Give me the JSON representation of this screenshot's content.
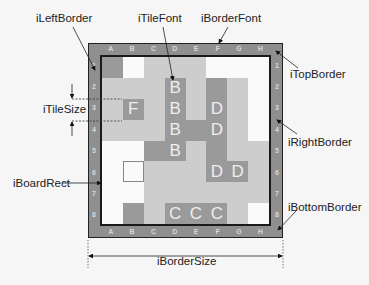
{
  "labels": {
    "left_border": "iLeftBorder",
    "tile_font": "iTileFont",
    "border_font": "iBorderFont",
    "top_border": "iTopBorder",
    "tile_size": "iTileSize",
    "right_border": "iRightBorder",
    "board_rect": "iBoardRect",
    "bottom_border": "iBottomBorder",
    "border_size": "iBorderSize"
  },
  "columns": [
    "A",
    "B",
    "C",
    "D",
    "E",
    "F",
    "G",
    "H"
  ],
  "rows": [
    "1",
    "2",
    "3",
    "4",
    "5",
    "6",
    "7",
    "8"
  ],
  "board": [
    [
      {
        "s": "dark",
        "t": ""
      },
      {
        "s": "white",
        "t": ""
      },
      {
        "s": "light",
        "t": ""
      },
      {
        "s": "light",
        "t": ""
      },
      {
        "s": "light",
        "t": ""
      },
      {
        "s": "white",
        "t": ""
      },
      {
        "s": "white",
        "t": ""
      },
      {
        "s": "white",
        "t": ""
      }
    ],
    [
      {
        "s": "light",
        "t": ""
      },
      {
        "s": "light",
        "t": ""
      },
      {
        "s": "light",
        "t": ""
      },
      {
        "s": "dark",
        "t": "B"
      },
      {
        "s": "light",
        "t": ""
      },
      {
        "s": "dark",
        "t": ""
      },
      {
        "s": "light",
        "t": ""
      },
      {
        "s": "white",
        "t": ""
      }
    ],
    [
      {
        "s": "light",
        "t": ""
      },
      {
        "s": "dark",
        "t": "F"
      },
      {
        "s": "light",
        "t": ""
      },
      {
        "s": "dark",
        "t": "B"
      },
      {
        "s": "light",
        "t": ""
      },
      {
        "s": "dark",
        "t": "D"
      },
      {
        "s": "light",
        "t": ""
      },
      {
        "s": "white",
        "t": ""
      }
    ],
    [
      {
        "s": "light",
        "t": ""
      },
      {
        "s": "light",
        "t": ""
      },
      {
        "s": "light",
        "t": ""
      },
      {
        "s": "dark",
        "t": "B"
      },
      {
        "s": "dark",
        "t": ""
      },
      {
        "s": "dark",
        "t": "D"
      },
      {
        "s": "light",
        "t": ""
      },
      {
        "s": "white",
        "t": ""
      }
    ],
    [
      {
        "s": "white",
        "t": ""
      },
      {
        "s": "white",
        "t": ""
      },
      {
        "s": "dark",
        "t": ""
      },
      {
        "s": "dark",
        "t": "B"
      },
      {
        "s": "light",
        "t": ""
      },
      {
        "s": "dark",
        "t": ""
      },
      {
        "s": "light",
        "t": ""
      },
      {
        "s": "light",
        "t": ""
      }
    ],
    [
      {
        "s": "white",
        "t": ""
      },
      {
        "s": "outline",
        "t": ""
      },
      {
        "s": "light",
        "t": ""
      },
      {
        "s": "light",
        "t": ""
      },
      {
        "s": "light",
        "t": ""
      },
      {
        "s": "dark",
        "t": "D"
      },
      {
        "s": "dark",
        "t": "D"
      },
      {
        "s": "light",
        "t": ""
      }
    ],
    [
      {
        "s": "white",
        "t": ""
      },
      {
        "s": "white",
        "t": ""
      },
      {
        "s": "light",
        "t": ""
      },
      {
        "s": "light",
        "t": ""
      },
      {
        "s": "light",
        "t": ""
      },
      {
        "s": "light",
        "t": ""
      },
      {
        "s": "light",
        "t": ""
      },
      {
        "s": "light",
        "t": ""
      }
    ],
    [
      {
        "s": "white",
        "t": ""
      },
      {
        "s": "dark",
        "t": ""
      },
      {
        "s": "light",
        "t": ""
      },
      {
        "s": "dark",
        "t": "C"
      },
      {
        "s": "dark",
        "t": "C"
      },
      {
        "s": "dark",
        "t": "C"
      },
      {
        "s": "light",
        "t": ""
      },
      {
        "s": "white",
        "t": ""
      }
    ]
  ],
  "colors": {
    "border": "#8f8f8f",
    "dark_tile": "#9a9a9a",
    "light_tile": "#cdcdcd",
    "white_tile": "#fafafa",
    "background": "#f6f6f6"
  }
}
